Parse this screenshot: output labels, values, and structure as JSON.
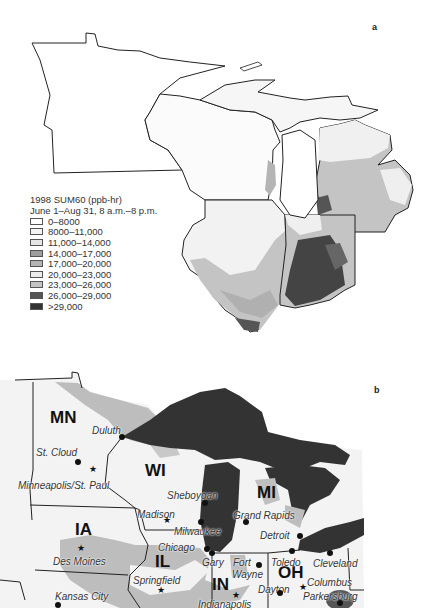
{
  "panels": {
    "a": {
      "label": "a"
    },
    "b": {
      "label": "b"
    }
  },
  "legend": {
    "title": "1998 SUM60 (ppb-hr)",
    "subtitle": "June 1–Aug 31, 8 a.m.–8 p.m.",
    "items": [
      {
        "label": "0–8000",
        "color": "#ffffff"
      },
      {
        "label": "8000–11,000",
        "color": "#f4f4f4"
      },
      {
        "label": "11,000–14,000",
        "color": "#e6e6e6"
      },
      {
        "label": "14,000–17,000",
        "color": "#9e9e9e"
      },
      {
        "label": "17,000–20,000",
        "color": "#b4b4b4"
      },
      {
        "label": "20,000–23,000",
        "color": "#ececec"
      },
      {
        "label": "23,000–26,000",
        "color": "#c4c4c4"
      },
      {
        "label": "26,000–29,000",
        "color": "#555555"
      },
      {
        "label": ">29,000",
        "color": "#333333"
      }
    ]
  },
  "map_b": {
    "states": [
      {
        "label": "MN",
        "x": 50,
        "y": 408
      },
      {
        "label": "WI",
        "x": 145,
        "y": 461
      },
      {
        "label": "MI",
        "x": 257,
        "y": 483
      },
      {
        "label": "IA",
        "x": 75,
        "y": 520
      },
      {
        "label": "IL",
        "x": 155,
        "y": 552
      },
      {
        "label": "IN",
        "x": 212,
        "y": 575
      },
      {
        "label": "OH",
        "x": 278,
        "y": 563
      }
    ],
    "cities": [
      {
        "label": "Duluth",
        "x": 92,
        "y": 425,
        "marker": "dot",
        "mx": 122,
        "my": 437
      },
      {
        "label": "St. Cloud",
        "x": 36,
        "y": 447,
        "marker": "dot",
        "mx": 78,
        "my": 462
      },
      {
        "label": "Minneapolis/St. Paul",
        "x": 18,
        "y": 480,
        "marker": "star",
        "mx": 93,
        "my": 469
      },
      {
        "label": "Sheboygan",
        "x": 167,
        "y": 490,
        "marker": "dot",
        "mx": 205,
        "my": 503
      },
      {
        "label": "Madison",
        "x": 137,
        "y": 509,
        "marker": "star",
        "mx": 167,
        "my": 520
      },
      {
        "label": "Milwaukee",
        "x": 174,
        "y": 526,
        "marker": "dot",
        "mx": 201,
        "my": 522
      },
      {
        "label": "Grand Rapids",
        "x": 233,
        "y": 510,
        "marker": "dot",
        "mx": 246,
        "my": 522
      },
      {
        "label": "Detroit",
        "x": 260,
        "y": 530,
        "marker": "dot",
        "mx": 300,
        "my": 536
      },
      {
        "label": "Chicago",
        "x": 158,
        "y": 542,
        "marker": "dot",
        "mx": 207,
        "my": 549
      },
      {
        "label": "Gary",
        "x": 202,
        "y": 557,
        "marker": "dot",
        "mx": 212,
        "my": 553
      },
      {
        "label": "Fort",
        "x": 233,
        "y": 557,
        "marker": "none"
      },
      {
        "label": "Wayne",
        "x": 232,
        "y": 569,
        "marker": "dot",
        "mx": 259,
        "my": 565
      },
      {
        "label": "Toledo",
        "x": 271,
        "y": 557,
        "marker": "dot",
        "mx": 292,
        "my": 551
      },
      {
        "label": "Cleveland",
        "x": 313,
        "y": 558,
        "marker": "dot",
        "mx": 330,
        "my": 553
      },
      {
        "label": "Des Moines",
        "x": 53,
        "y": 556,
        "marker": "star",
        "mx": 81,
        "my": 548
      },
      {
        "label": "Springfield",
        "x": 133,
        "y": 575,
        "marker": "star",
        "mx": 161,
        "my": 590
      },
      {
        "label": "Columbus",
        "x": 307,
        "y": 577,
        "marker": "star",
        "mx": 303,
        "my": 587
      },
      {
        "label": "Dayton",
        "x": 258,
        "y": 584,
        "marker": "dot",
        "mx": 280,
        "my": 593
      },
      {
        "label": "Parkersburg",
        "x": 303,
        "y": 591,
        "marker": "dot",
        "mx": 340,
        "my": 603
      },
      {
        "label": "Kansas City",
        "x": 55,
        "y": 591,
        "marker": "dot",
        "mx": 58,
        "my": 605
      },
      {
        "label": "Indianapolis",
        "x": 198,
        "y": 599,
        "marker": "star",
        "mx": 236,
        "my": 595
      }
    ]
  }
}
